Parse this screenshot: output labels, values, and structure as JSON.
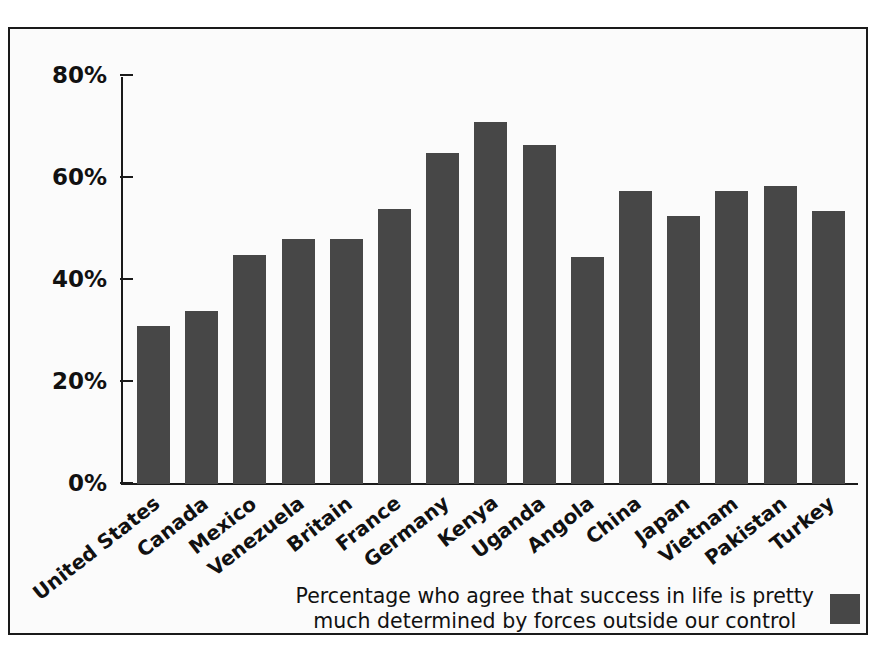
{
  "chart_data": {
    "type": "bar",
    "title": "",
    "subtitle": "",
    "xlabel": "",
    "ylabel": "",
    "ylim": [
      0,
      80
    ],
    "grid": false,
    "legend_position": "bottom-right",
    "bar_color": "#474747",
    "categories": [
      "United States",
      "Canada",
      "Mexico",
      "Venezuela",
      "Britain",
      "France",
      "Germany",
      "Kenya",
      "Uganda",
      "Angola",
      "China",
      "Japan",
      "Vietnam",
      "Pakistan",
      "Turkey"
    ],
    "values": [
      31,
      34,
      45,
      48,
      48,
      54,
      65,
      71,
      66.5,
      44.5,
      57.5,
      52.5,
      57.5,
      58.5,
      53.5
    ],
    "series": [
      {
        "name": "Percentage who agree that success in life is pretty much determined by forces outside our control",
        "values": [
          31,
          34,
          45,
          48,
          48,
          54,
          65,
          71,
          66.5,
          44.5,
          57.5,
          52.5,
          57.5,
          58.5,
          53.5
        ]
      }
    ],
    "y_ticks": [
      0,
      20,
      40,
      60,
      80
    ],
    "y_tick_labels": [
      "0%",
      "20%",
      "40%",
      "60%",
      "80%"
    ]
  },
  "legend": {
    "line1": "Percentage who agree that success in life is pretty",
    "line2": "much determined by forces outside our control",
    "swatch_color": "#474747"
  }
}
